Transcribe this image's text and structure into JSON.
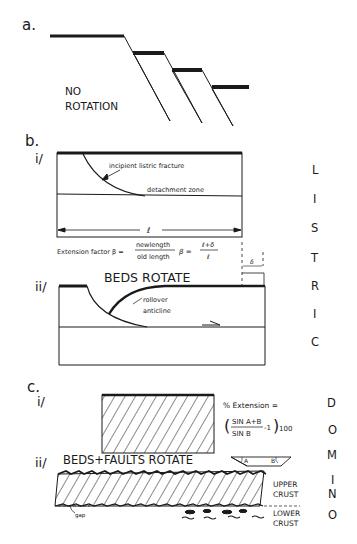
{
  "panel_a": {
    "label": "a.",
    "caption_line1": "NO",
    "caption_line2": "ROTATION"
  },
  "panel_b": {
    "label": "b.",
    "sub_i": "i/",
    "sub_ii": "ii/",
    "fracture_label": "incipient listric fracture",
    "detachment_label": "detachment zone",
    "length_symbol": "ℓ",
    "extension_prefix": "Extension factor β =",
    "frac1_num": "newlength",
    "frac1_den": "old length",
    "beta": "β =",
    "frac2_num": "ℓ+δ",
    "frac2_den": "ℓ",
    "delta": "δ",
    "beds_rotate": "BEDS ROTATE",
    "rollover_line1": "rollover",
    "rollover_line2": "anticline",
    "side_letters": [
      "L",
      "I",
      "S",
      "T",
      "R",
      "I",
      "C"
    ]
  },
  "panel_c": {
    "label": "c.",
    "sub_i": "i/",
    "sub_ii": "ii/",
    "extension_title": "% Extension =",
    "formula_num": "SIN A+B",
    "formula_den": "SIN B",
    "formula_tail": "-1",
    "formula_mult": "100",
    "beds_faults_rotate": "BEDS+FAULTS ROTATE",
    "angle_a": "A",
    "angle_b": "B",
    "upper_crust_1": "UPPER",
    "upper_crust_2": "CRUST",
    "lower_crust_1": "LOWER",
    "lower_crust_2": "CRUST",
    "gap_label": "gap",
    "side_letters": [
      "D",
      "O",
      "M",
      "I",
      "N",
      "O"
    ]
  }
}
